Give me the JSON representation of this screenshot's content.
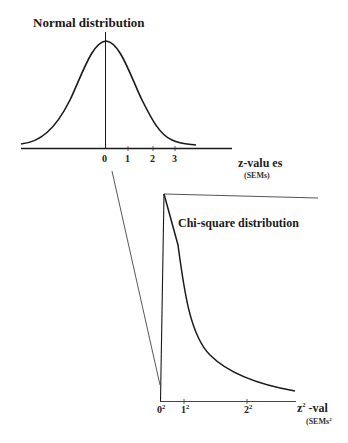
{
  "normal": {
    "title": "Normal distribution",
    "ticks": [
      "0",
      "1",
      "2",
      "3"
    ],
    "axis_label": "z-valu es",
    "axis_unit": "(SEMs)"
  },
  "chisq": {
    "title": "Chi-square distribution",
    "ticks": [
      "0",
      "1",
      "2"
    ],
    "tick_exp": "2",
    "axis_label_base": "z",
    "axis_label_exp": "2",
    "axis_label_rest": " -val",
    "axis_unit_base": "(SEMs",
    "axis_unit_exp": "2"
  },
  "colors": {
    "line": "#1a1a1a",
    "thin_line": "#555555",
    "background": "#ffffff"
  }
}
